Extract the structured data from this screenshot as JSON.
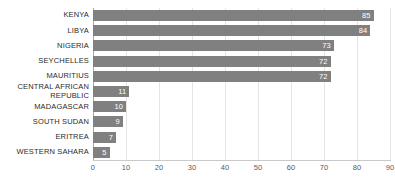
{
  "chart_data": {
    "type": "bar",
    "orientation": "horizontal",
    "title": "",
    "subtitle": "",
    "xlabel": "",
    "ylabel": "",
    "categories": [
      "KENYA",
      "LIBYA",
      "NIGERIA",
      "SEYCHELLES",
      "MAURITIUS",
      "CENTRAL AFRICAN REPUBLIC",
      "MADAGASCAR",
      "SOUTH SUDAN",
      "ERITREA",
      "WESTERN SAHARA"
    ],
    "values": [
      85,
      84,
      73,
      72,
      72,
      11,
      10,
      9,
      7,
      5
    ],
    "value_labels": [
      "85",
      "84",
      "73",
      "72",
      "72",
      "11",
      "10",
      "9",
      "7",
      "5"
    ],
    "xlim": [
      0,
      90
    ],
    "xticks": [
      0,
      10,
      20,
      30,
      40,
      50,
      60,
      70,
      80,
      90
    ],
    "xtick_labels": [
      "0",
      "10",
      "20",
      "30",
      "40",
      "50",
      "60",
      "70",
      "80",
      "90"
    ],
    "grid": true,
    "legend": false,
    "bar_color": "#808080",
    "value_label_color": "#ffffff",
    "axis_color": "#a8a8a8",
    "grid_color": "#e4e4e4",
    "tick_label_color": "#5a5a5a",
    "category_label_color": "#2b2b2b",
    "background": "#ffffff"
  }
}
